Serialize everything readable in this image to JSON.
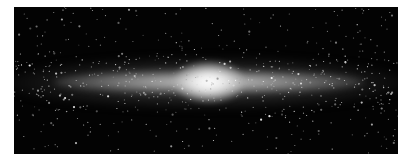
{
  "image": {
    "subject": "Edge-on spiral galaxy (infrared view) with bright central bulge and star field",
    "colors": {
      "background": "#030303",
      "disk": "#b4b4b4",
      "bulge": "#ffffff",
      "page": "#ffffff"
    }
  }
}
